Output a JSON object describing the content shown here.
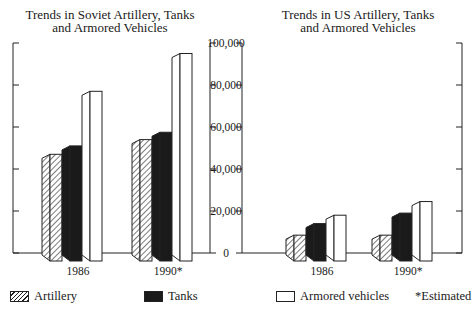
{
  "chart_data": [
    {
      "type": "bar",
      "title": "Trends in Soviet Artillery, Tanks and Armored Vehicles",
      "categories": [
        "1986",
        "1990*"
      ],
      "series": [
        {
          "name": "Artillery",
          "values": [
            47000,
            54000
          ]
        },
        {
          "name": "Tanks",
          "values": [
            51000,
            57500
          ]
        },
        {
          "name": "Armored vehicles",
          "values": [
            77000,
            95000
          ]
        }
      ],
      "xlabel": "",
      "ylabel": "",
      "ylim": [
        0,
        100000
      ],
      "yticks": [
        "0",
        "20,000",
        "40,000",
        "60,000",
        "80,000",
        "100,000"
      ],
      "grid": false
    },
    {
      "type": "bar",
      "title": "Trends in US Artillery, Tanks and Armored Vehicles",
      "categories": [
        "1986",
        "1990*"
      ],
      "series": [
        {
          "name": "Artillery",
          "values": [
            8500,
            8500
          ]
        },
        {
          "name": "Tanks",
          "values": [
            14000,
            19000
          ]
        },
        {
          "name": "Armored vehicles",
          "values": [
            18000,
            24500
          ]
        }
      ],
      "xlabel": "",
      "ylabel": "",
      "ylim": [
        0,
        100000
      ],
      "yticks": [
        "0",
        "20,000",
        "40,000",
        "60,000",
        "80,000",
        "100,000"
      ],
      "grid": false
    }
  ],
  "titles": {
    "soviet_line1": "Trends in Soviet Artillery, Tanks",
    "soviet_line2": "and Armored Vehicles",
    "us_line1": "Trends in US Artillery, Tanks",
    "us_line2": "and Armored Vehicles"
  },
  "axis": {
    "ticks": [
      "100,000",
      "80,000",
      "60,000",
      "40,000",
      "20,000",
      "0"
    ]
  },
  "categories": [
    "1986",
    "1990*"
  ],
  "legend": {
    "artillery": "Artillery",
    "tanks": "Tanks",
    "armored": "Armored vehicles",
    "note": "*Estimated"
  },
  "colors": {
    "ink": "#1a1a1a",
    "paper": "#ffffff"
  }
}
